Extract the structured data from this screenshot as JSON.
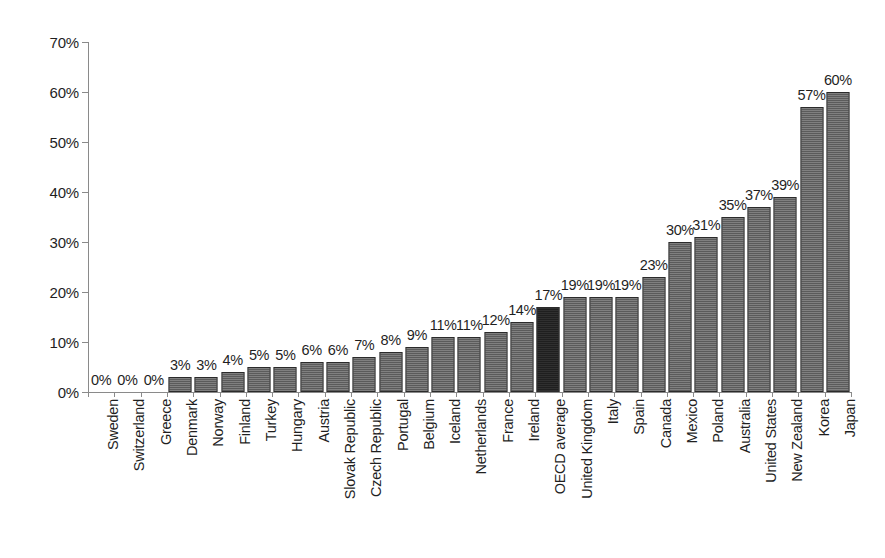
{
  "chart_data": {
    "type": "bar",
    "title": "",
    "subtitle": "",
    "xlabel": "",
    "ylabel": "",
    "ylim": [
      0,
      70
    ],
    "y_tick_labels": [
      "0%",
      "10%",
      "20%",
      "30%",
      "40%",
      "50%",
      "60%",
      "70%"
    ],
    "y_ticks": [
      0,
      10,
      20,
      30,
      40,
      50,
      60,
      70
    ],
    "grid": false,
    "legend": "none",
    "value_label_suffix": "%",
    "categories": [
      "Sweden",
      "Switzerland",
      "Greece",
      "Denmark",
      "Norway",
      "Finland",
      "Turkey",
      "Hungary",
      "Austria",
      "Slovak Republic",
      "Czech Republic",
      "Portugal",
      "Belgium",
      "Iceland",
      "Netherlands",
      "France",
      "Ireland",
      "OECD average",
      "United Kingdom",
      "Italy",
      "Spain",
      "Canada",
      "Mexico",
      "Poland",
      "Australia",
      "United States",
      "New Zealand",
      "Korea",
      "Japan"
    ],
    "values": [
      0,
      0,
      0,
      3,
      3,
      4,
      5,
      5,
      6,
      6,
      7,
      8,
      9,
      11,
      11,
      12,
      14,
      17,
      19,
      19,
      19,
      23,
      30,
      31,
      35,
      37,
      39,
      57,
      60
    ],
    "value_labels": [
      "0%",
      "0%",
      "0%",
      "3%",
      "3%",
      "4%",
      "5%",
      "5%",
      "6%",
      "6%",
      "7%",
      "8%",
      "9%",
      "11%",
      "11%",
      "12%",
      "14%",
      "17%",
      "19%",
      "19%",
      "19%",
      "23%",
      "30%",
      "31%",
      "35%",
      "37%",
      "39%",
      "57%",
      "60%"
    ],
    "highlight_category": "OECD average",
    "highlight_index": 17,
    "colors": {
      "bar_fill": "#9a9a9a",
      "bar_border": "#2b2b2b",
      "highlight_fill": "#3a3a3a",
      "axis": "#8a8a8a",
      "text": "#1f1f1f",
      "background": "#ffffff"
    }
  }
}
